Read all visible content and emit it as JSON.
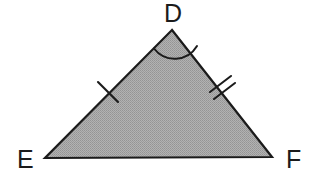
{
  "figure": {
    "kind": "geometry-diagram",
    "shape": "triangle",
    "name": "triangle-DEF",
    "background_color": "#ffffff",
    "fill_color": "#a6a6a6",
    "stroke_color": "#1b1b1b",
    "vertices": [
      {
        "id": "D",
        "label": "D",
        "x": 172,
        "y": 30,
        "role": "apex"
      },
      {
        "id": "E",
        "label": "E",
        "x": 45,
        "y": 158,
        "role": "base-left"
      },
      {
        "id": "F",
        "label": "F",
        "x": 272,
        "y": 157,
        "role": "base-right"
      }
    ],
    "sides": [
      {
        "id": "DE",
        "from": "D",
        "to": "E",
        "tick_marks": 1,
        "note": "single tick"
      },
      {
        "id": "DF",
        "from": "D",
        "to": "F",
        "tick_marks": 2,
        "note": "double tick"
      },
      {
        "id": "EF",
        "from": "E",
        "to": "F",
        "tick_marks": 0,
        "note": "base, unmarked"
      }
    ],
    "angle_marks": [
      {
        "id": "angle-D",
        "at_vertex": "D",
        "arcs": 1,
        "radius": 26
      }
    ],
    "labels": {
      "D": "D",
      "E": "E",
      "F": "F"
    }
  }
}
